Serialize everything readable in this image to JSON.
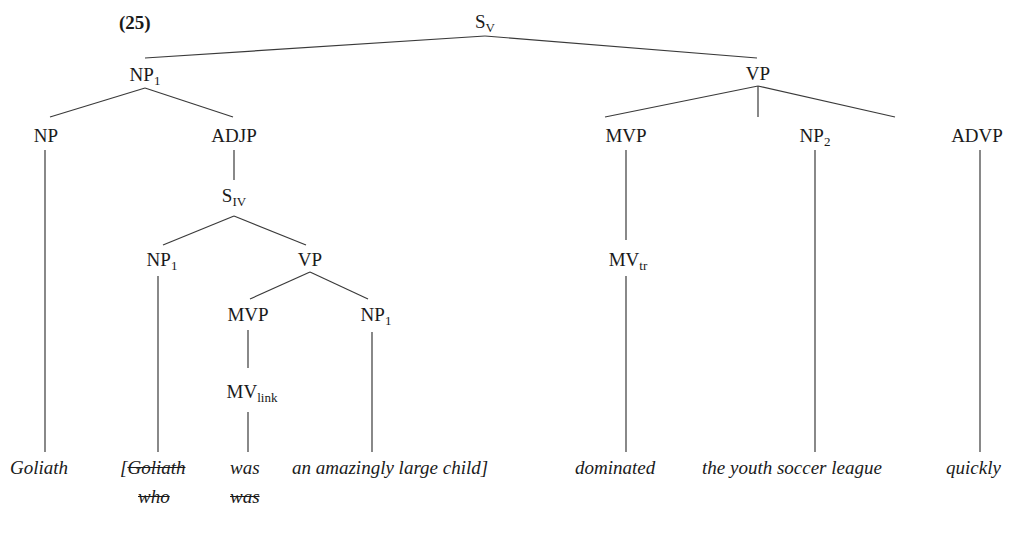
{
  "example_number": "(25)",
  "tree": {
    "nodes": {
      "s_root": {
        "label": "S",
        "sub": "V"
      },
      "np1_top": {
        "label": "NP",
        "sub": "1"
      },
      "vp_top": {
        "label": "VP",
        "sub": ""
      },
      "np_left": {
        "label": "NP",
        "sub": ""
      },
      "adjp": {
        "label": "ADJP",
        "sub": ""
      },
      "s_iv": {
        "label": "S",
        "sub": "IV"
      },
      "np1_inner": {
        "label": "NP",
        "sub": "1"
      },
      "vp_inner": {
        "label": "VP",
        "sub": ""
      },
      "mvp_inner": {
        "label": "MVP",
        "sub": ""
      },
      "np1_pred": {
        "label": "NP",
        "sub": "1"
      },
      "mv_link": {
        "label": "MV",
        "sub": "link"
      },
      "mvp_top": {
        "label": "MVP",
        "sub": ""
      },
      "np2": {
        "label": "NP",
        "sub": "2"
      },
      "advp": {
        "label": "ADVP",
        "sub": ""
      },
      "mv_tr": {
        "label": "MV",
        "sub": "tr"
      }
    },
    "words": {
      "goliath": "Goliath",
      "bracket_open": "[",
      "goliath_deleted": "Goliath",
      "who_deleted": "who",
      "was": "was",
      "was_deleted": "was",
      "an_amazingly_large_child": "an amazingly large child]",
      "dominated": "dominated",
      "the_youth_soccer_league": "the youth soccer league",
      "quickly": "quickly"
    }
  }
}
